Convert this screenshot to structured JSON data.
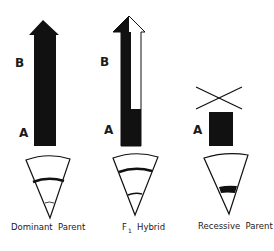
{
  "diagram": {
    "colors": {
      "ink": "#111111",
      "paper": "#ffffff"
    },
    "panels": [
      {
        "id": "dominant",
        "caption": "Dominant  Parent",
        "arrow_label_top": "B",
        "arrow_label_bottom": "A",
        "arrow_type": "full-black-arrow",
        "wedge_bands": [
          "thick band upper",
          "thin band near tip"
        ]
      },
      {
        "id": "f1",
        "caption_main": "F",
        "caption_sub": "1",
        "caption_rest": "Hybrid",
        "arrow_label_top": "B",
        "arrow_label_bottom": "A",
        "arrow_type": "half-black-half-white-arrow",
        "wedge_bands": [
          "thick band upper",
          "medium band lower"
        ]
      },
      {
        "id": "recessive",
        "caption": "Recessive  Parent",
        "arrow_label_bottom": "A",
        "arrow_type": "short-black-block-with-x",
        "wedge_bands": [
          "thick band lower"
        ]
      }
    ]
  }
}
